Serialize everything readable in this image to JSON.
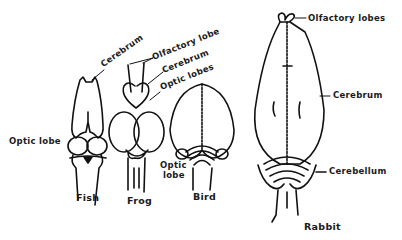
{
  "labels": {
    "fish_cerebrum": "Cerebrum",
    "fish_optic_lobe": "Optic lobe",
    "frog_olfactory_lobe": "Olfactory lobe",
    "frog_cerebrum": "Cerebrum",
    "frog_optic_lobes": "Optic lobes",
    "bird_optic_lobe_line1": "Optic",
    "bird_optic_lobe_line2": "lobe",
    "rabbit_olfactory_lobes": "Olfactory lobes",
    "rabbit_cerebrum": "Cerebrum",
    "rabbit_cerebellum": "Cerebellum"
  },
  "captions": {
    "fish": "Fish",
    "frog": "Frog",
    "bird": "Bird",
    "rabbit": "Rabbit"
  },
  "colors": {
    "ink": "#111111",
    "background": "#ffffff"
  }
}
